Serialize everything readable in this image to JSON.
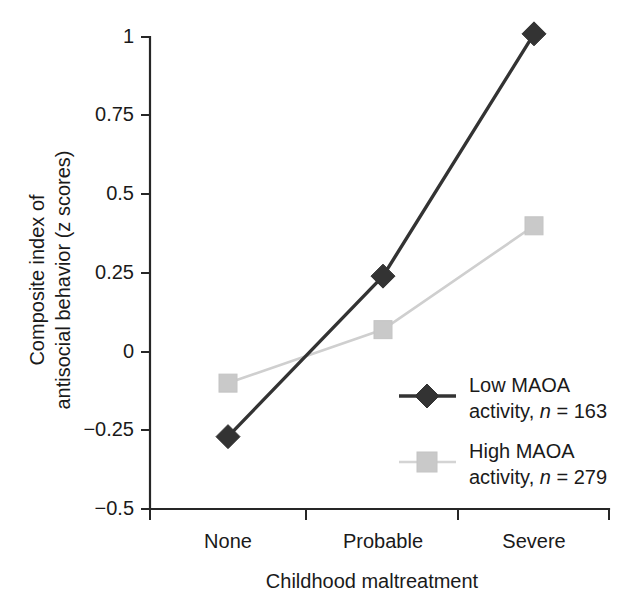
{
  "chart_data": {
    "type": "line",
    "title": "",
    "subtitle": "",
    "xlabel": "Childhood maltreatment",
    "ylabel_line1": "Composite index of",
    "ylabel_line2": "antisocial behavior (z scores)",
    "ylabel": "Composite index of antisocial behavior (z scores)",
    "categories": [
      "None",
      "Probable",
      "Severe"
    ],
    "ylim": [
      -0.5,
      1.0
    ],
    "yticks": [
      1,
      0.75,
      0.5,
      0.25,
      0,
      -0.25,
      -0.5
    ],
    "ytick_labels": [
      "1",
      "0.75",
      "0.5",
      "0.25",
      "0",
      "−0.25",
      "−0.5"
    ],
    "grid": false,
    "legend_position": "inside-lower-right",
    "series": [
      {
        "name": "Low MAOA activity",
        "legend_line1": "Low MAOA",
        "legend_line2_prefix": "activity, ",
        "legend_line2_italic": "n",
        "legend_line2_suffix": " = 163",
        "n": 163,
        "marker": "diamond",
        "color": "#333333",
        "values": [
          -0.27,
          0.24,
          1.01
        ]
      },
      {
        "name": "High MAOA activity",
        "legend_line1": "High MAOA",
        "legend_line2_prefix": "activity, ",
        "legend_line2_italic": "n",
        "legend_line2_suffix": " = 279",
        "n": 279,
        "marker": "square",
        "color": "#c9c9c9",
        "values": [
          -0.1,
          0.07,
          0.4
        ]
      }
    ]
  },
  "colors": {
    "axis": "#262626",
    "text": "#1a1a1a",
    "series_low": "#333333",
    "series_high": "#c9c9c9",
    "background": "#ffffff"
  }
}
